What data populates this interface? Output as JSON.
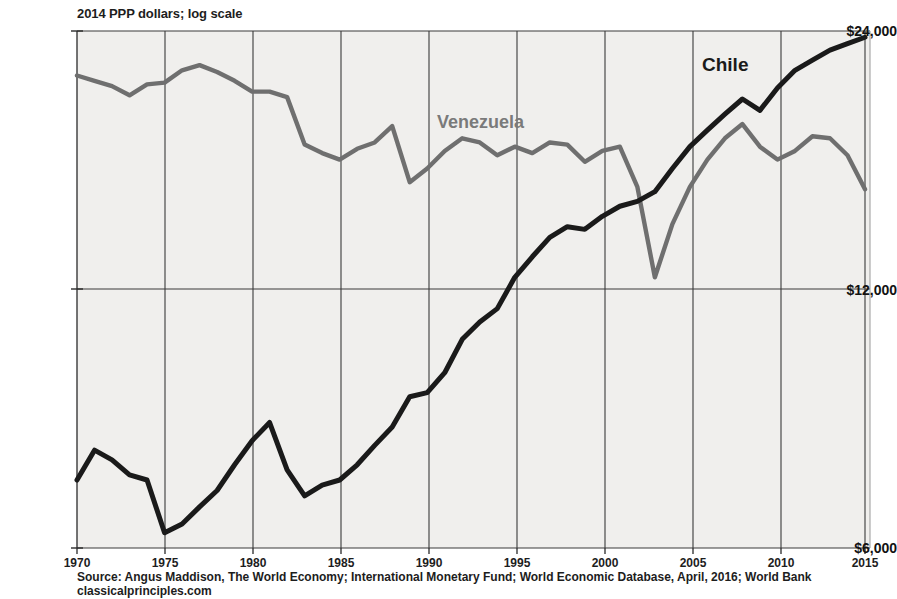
{
  "subtitle": "2014 PPP dollars; log scale",
  "top_clipped_text": "",
  "source": "Source:  Angus Maddison, The World Economy; International Monetary Fund; World Economic Database, April, 2016; World Bank classicalprinciples.com",
  "colors": {
    "chile": "#1a1a1a",
    "venezuela": "#6f6f6f",
    "plot_background": "#f0efed",
    "gridline": "#3a3a3a",
    "axis": "#2a2a2a",
    "page_background": "#ffffff"
  },
  "axis": {
    "y_ticks": [
      "$24,000",
      "$12,000",
      "$6,000"
    ],
    "y_tick_values": [
      24000,
      12000,
      6000
    ],
    "x_ticks": [
      "1970",
      "1975",
      "1980",
      "1985",
      "1990",
      "1995",
      "2000",
      "2005",
      "2010",
      "2015"
    ],
    "x_tick_values": [
      1970,
      1975,
      1980,
      1985,
      1990,
      1995,
      2000,
      2005,
      2010,
      2015
    ]
  },
  "series_labels": {
    "venezuela": "Venezuela",
    "chile": "Chile"
  },
  "chart_data": {
    "type": "line",
    "title": "",
    "subtitle": "2014 PPP dollars; log scale",
    "xlabel": "",
    "ylabel": "2014 PPP dollars",
    "yscale": "log",
    "ylim": [
      6000,
      24000
    ],
    "xlim": [
      1970,
      2015
    ],
    "grid": true,
    "legend_position": "inline-annotation",
    "x": [
      1970,
      1971,
      1972,
      1973,
      1974,
      1975,
      1976,
      1977,
      1978,
      1979,
      1980,
      1981,
      1982,
      1983,
      1984,
      1985,
      1986,
      1987,
      1988,
      1989,
      1990,
      1991,
      1992,
      1993,
      1994,
      1995,
      1996,
      1997,
      1998,
      1999,
      2000,
      2001,
      2002,
      2003,
      2004,
      2005,
      2006,
      2007,
      2008,
      2009,
      2010,
      2011,
      2012,
      2013,
      2014,
      2015
    ],
    "series": [
      {
        "name": "Venezuela",
        "color": "#6f6f6f",
        "values": [
          21300,
          21000,
          20700,
          20200,
          20800,
          20900,
          21600,
          21900,
          21500,
          21000,
          20400,
          20400,
          20100,
          17700,
          17300,
          17000,
          17500,
          17800,
          18600,
          16000,
          16600,
          17400,
          18000,
          17800,
          17200,
          17600,
          17300,
          17800,
          17700,
          16900,
          17400,
          17600,
          15800,
          12400,
          14300,
          15800,
          17000,
          18000,
          18700,
          17600,
          17000,
          17400,
          18100,
          18000,
          17200,
          15700
        ]
      },
      {
        "name": "Chile",
        "color": "#1a1a1a",
        "values": [
          7200,
          7800,
          7600,
          7300,
          7200,
          6250,
          6400,
          6700,
          7000,
          7500,
          8000,
          8400,
          7400,
          6900,
          7100,
          7200,
          7500,
          7900,
          8300,
          9000,
          9100,
          9600,
          10500,
          11000,
          11400,
          12400,
          13100,
          13800,
          14200,
          14100,
          14600,
          15000,
          15200,
          15600,
          16600,
          17600,
          18400,
          19200,
          20000,
          19400,
          20600,
          21600,
          22200,
          22800,
          23200,
          23600
        ]
      }
    ]
  }
}
